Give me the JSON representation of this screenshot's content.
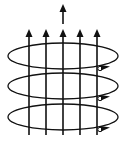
{
  "diagram": {
    "colors": {
      "stroke": "#111111",
      "background": "#ffffff"
    },
    "field_lines": {
      "count": 5,
      "direction": "up"
    },
    "coil_loops": {
      "count": 3,
      "current_direction_marker": "arrow-right-front"
    },
    "center_arrow": {
      "direction": "up"
    }
  }
}
